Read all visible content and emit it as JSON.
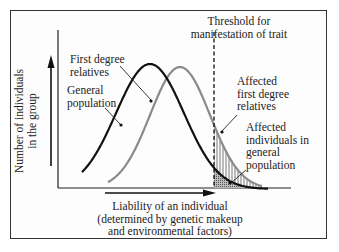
{
  "diagram": {
    "threshold_label": [
      "Threshold for",
      "manifestation of trait"
    ],
    "y_axis_label": [
      "Number of individuals",
      "in the group"
    ],
    "x_axis_label": [
      "Liability of an individual",
      "(determined by genetic makeup",
      "and environmental factors)"
    ],
    "curves": [
      {
        "name": "General population",
        "label": [
          "General",
          "population"
        ],
        "color": "#111111"
      },
      {
        "name": "First degree relatives",
        "label": [
          "First degree",
          "relatives"
        ],
        "color": "#8a8a8a"
      }
    ],
    "shaded_regions": [
      {
        "label": [
          "Affected",
          "first degree",
          "relatives"
        ],
        "pattern": "vertical-hatch"
      },
      {
        "label": [
          "Affected",
          "individuals in",
          "general",
          "population"
        ],
        "pattern": "stipple"
      }
    ]
  }
}
